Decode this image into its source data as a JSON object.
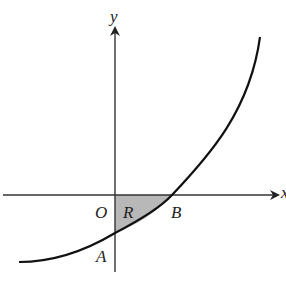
{
  "diagram": {
    "type": "graph-sketch",
    "labels": {
      "y_axis": "y",
      "x_axis": "x",
      "origin": "O",
      "region": "R",
      "x_intercept": "B",
      "y_intercept": "A"
    },
    "colors": {
      "line": "#111111",
      "axis": "#333333",
      "shade": "#b8b8b8"
    }
  }
}
